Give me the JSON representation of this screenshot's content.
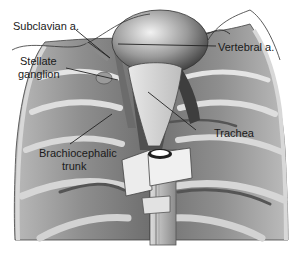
{
  "diagram": {
    "type": "anatomical-illustration",
    "colors": {
      "background": "#ffffff",
      "tissue_dark": "#5a5a5a",
      "tissue_mid": "#8c8c8c",
      "tissue_light": "#c8c8c8",
      "highlight": "#eeeeee",
      "outline": "#333333",
      "label_text": "#1a1a1a"
    },
    "labels": [
      {
        "id": "subclavian",
        "text": "Subclavian a."
      },
      {
        "id": "stellate_line1",
        "text": "Stellate"
      },
      {
        "id": "stellate_line2",
        "text": "ganglion"
      },
      {
        "id": "vertebral",
        "text": "Vertebral a."
      },
      {
        "id": "brachio_line1",
        "text": "Brachiocephalic"
      },
      {
        "id": "brachio_line2",
        "text": "trunk"
      },
      {
        "id": "trachea",
        "text": "Trachea"
      }
    ]
  }
}
